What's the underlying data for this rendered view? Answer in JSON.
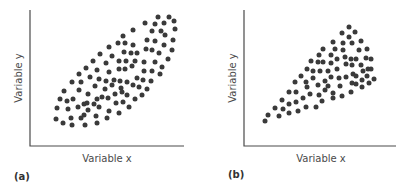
{
  "panels": [
    {
      "id": "a",
      "panel_label": "(a)",
      "xlabel": "Variable x",
      "ylabel": "Variable y"
    },
    {
      "id": "b",
      "panel_label": "(b)",
      "xlabel": "Variable x",
      "ylabel": "Variable y"
    }
  ],
  "colors": {
    "dot": "#3a3a3a",
    "axis": "#4a4a4a"
  },
  "chart_data": [
    {
      "type": "scatter",
      "title": "(a)",
      "xlabel": "Variable x",
      "ylabel": "Variable y",
      "description": "Homoscedastic positive relationship: elliptical band of uniform width",
      "pixel_points": [
        [
          158,
          17
        ],
        [
          169,
          17
        ],
        [
          145,
          23
        ],
        [
          155,
          24
        ],
        [
          164,
          23
        ],
        [
          174,
          21
        ],
        [
          175,
          29
        ],
        [
          133,
          30
        ],
        [
          152,
          31
        ],
        [
          161,
          31
        ],
        [
          165,
          35
        ],
        [
          123,
          36
        ],
        [
          147,
          40
        ],
        [
          155,
          41
        ],
        [
          173,
          40
        ],
        [
          118,
          43
        ],
        [
          125,
          43
        ],
        [
          133,
          45
        ],
        [
          109,
          47
        ],
        [
          164,
          45
        ],
        [
          124,
          52
        ],
        [
          131,
          53
        ],
        [
          137,
          53
        ],
        [
          146,
          49
        ],
        [
          152,
          50
        ],
        [
          159,
          53
        ],
        [
          172,
          50
        ],
        [
          100,
          54
        ],
        [
          112,
          56
        ],
        [
          168,
          59
        ],
        [
          93,
          61
        ],
        [
          106,
          63
        ],
        [
          119,
          61
        ],
        [
          126,
          61
        ],
        [
          135,
          61
        ],
        [
          144,
          62
        ],
        [
          155,
          62
        ],
        [
          162,
          67
        ],
        [
          86,
          68
        ],
        [
          97,
          70
        ],
        [
          109,
          72
        ],
        [
          119,
          69
        ],
        [
          125,
          69
        ],
        [
          132,
          66
        ],
        [
          144,
          71
        ],
        [
          152,
          71
        ],
        [
          160,
          74
        ],
        [
          79,
          74
        ],
        [
          90,
          77
        ],
        [
          99,
          79
        ],
        [
          106,
          81
        ],
        [
          114,
          80
        ],
        [
          120,
          81
        ],
        [
          127,
          82
        ],
        [
          137,
          78
        ],
        [
          143,
          80
        ],
        [
          151,
          81
        ],
        [
          72,
          82
        ],
        [
          81,
          82
        ],
        [
          95,
          86
        ],
        [
          105,
          89
        ],
        [
          112,
          85
        ],
        [
          121,
          88
        ],
        [
          133,
          85
        ],
        [
          139,
          87
        ],
        [
          147,
          89
        ],
        [
          64,
          91
        ],
        [
          79,
          90
        ],
        [
          88,
          94
        ],
        [
          97,
          99
        ],
        [
          102,
          97
        ],
        [
          108,
          98
        ],
        [
          115,
          94
        ],
        [
          122,
          92
        ],
        [
          127,
          95
        ],
        [
          135,
          99
        ],
        [
          142,
          95
        ],
        [
          60,
          99
        ],
        [
          67,
          101
        ],
        [
          73,
          99
        ],
        [
          87,
          103
        ],
        [
          94,
          104
        ],
        [
          99,
          107
        ],
        [
          109,
          111
        ],
        [
          116,
          103
        ],
        [
          123,
          102
        ],
        [
          129,
          107
        ],
        [
          57,
          108
        ],
        [
          68,
          109
        ],
        [
          78,
          107
        ],
        [
          84,
          104
        ],
        [
          88,
          110
        ],
        [
          119,
          113
        ],
        [
          56,
          119
        ],
        [
          63,
          123
        ],
        [
          71,
          118
        ],
        [
          72,
          125
        ],
        [
          81,
          118
        ],
        [
          84,
          115
        ],
        [
          85,
          125
        ],
        [
          96,
          116
        ],
        [
          97,
          123
        ],
        [
          107,
          118
        ]
      ]
    },
    {
      "type": "scatter",
      "title": "(b)",
      "xlabel": "Variable x",
      "ylabel": "Variable y",
      "description": "Heteroscedastic positive relationship: fan shape widening as x increases",
      "pixel_points": [
        [
          265,
          121
        ],
        [
          268,
          115
        ],
        [
          275,
          108
        ],
        [
          279,
          116
        ],
        [
          282,
          100
        ],
        [
          283,
          109
        ],
        [
          289,
          92
        ],
        [
          289,
          104
        ],
        [
          289,
          113
        ],
        [
          295,
          82
        ],
        [
          296,
          92
        ],
        [
          296,
          102
        ],
        [
          298,
          111
        ],
        [
          301,
          76
        ],
        [
          303,
          98
        ],
        [
          306,
          107
        ],
        [
          307,
          69
        ],
        [
          306,
          82
        ],
        [
          307,
          87
        ],
        [
          313,
          71
        ],
        [
          313,
          78
        ],
        [
          310,
          94
        ],
        [
          316,
          107
        ],
        [
          311,
          61
        ],
        [
          319,
          55
        ],
        [
          323,
          49
        ],
        [
          318,
          62
        ],
        [
          323,
          62
        ],
        [
          320,
          71
        ],
        [
          325,
          81
        ],
        [
          318,
          85
        ],
        [
          325,
          90
        ],
        [
          319,
          95
        ],
        [
          322,
          101
        ],
        [
          333,
          42
        ],
        [
          331,
          55
        ],
        [
          331,
          63
        ],
        [
          328,
          71
        ],
        [
          331,
          77
        ],
        [
          328,
          86
        ],
        [
          333,
          93
        ],
        [
          333,
          98
        ],
        [
          335,
          49
        ],
        [
          337,
          59
        ],
        [
          337,
          69
        ],
        [
          339,
          78
        ],
        [
          340,
          86
        ],
        [
          342,
          96
        ],
        [
          342,
          33
        ],
        [
          343,
          43
        ],
        [
          343,
          50
        ],
        [
          345,
          57
        ],
        [
          346,
          64
        ],
        [
          346,
          77
        ],
        [
          349,
          37
        ],
        [
          349,
          27
        ],
        [
          352,
          43
        ],
        [
          351,
          59
        ],
        [
          352,
          65
        ],
        [
          353,
          74
        ],
        [
          352,
          83
        ],
        [
          351,
          92
        ],
        [
          355,
          32
        ],
        [
          361,
          41
        ],
        [
          359,
          50
        ],
        [
          356,
          59
        ],
        [
          361,
          65
        ],
        [
          363,
          71
        ],
        [
          356,
          76
        ],
        [
          356,
          84
        ],
        [
          362,
          80
        ],
        [
          362,
          87
        ],
        [
          367,
          49
        ],
        [
          366,
          58
        ],
        [
          368,
          69
        ],
        [
          371,
          59
        ],
        [
          367,
          76
        ],
        [
          369,
          83
        ],
        [
          371,
          69
        ],
        [
          374,
          79
        ]
      ]
    }
  ]
}
